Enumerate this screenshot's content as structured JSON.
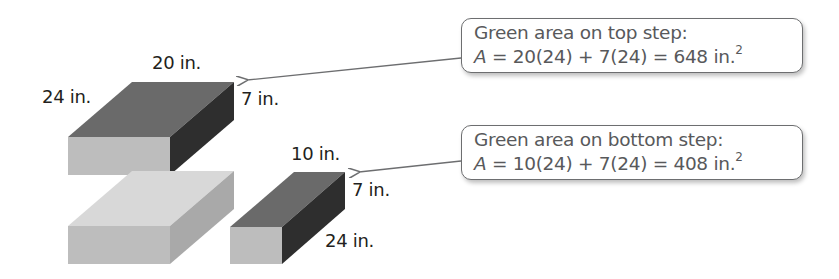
{
  "figure": {
    "top_block": {
      "labels": {
        "length": "20 in.",
        "width": "24 in.",
        "height": "7 in."
      },
      "colors": {
        "top": "#6a6a6a",
        "front": "#bdbdbd",
        "side": "#2e2e2e"
      }
    },
    "bottom_block": {
      "colors": {
        "top": "#d8d8d8",
        "front": "#bdbdbd",
        "side": "#a9a9a9"
      }
    },
    "small_block": {
      "labels": {
        "length": "10 in.",
        "height": "7 in.",
        "depth": "24 in."
      },
      "colors": {
        "top": "#6a6a6a",
        "front": "#bdbdbd",
        "side": "#2e2e2e"
      }
    }
  },
  "callouts": [
    {
      "title": "Green area on top step:",
      "var": "A",
      "expr": " = 20(24) + 7(24) = 648 in.",
      "exp": "2"
    },
    {
      "title": "Green area on bottom step:",
      "var": "A",
      "expr": " = 10(24) + 7(24) = 408 in.",
      "exp": "2"
    }
  ],
  "arrow_color": "#6d6e70"
}
